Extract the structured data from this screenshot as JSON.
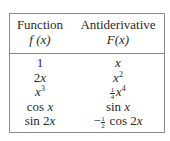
{
  "table": {
    "headers": [
      {
        "title": "Function",
        "notation": "f(x)"
      },
      {
        "title": "Antiderivative",
        "notation": "F(x)"
      }
    ],
    "rows": [
      {
        "function": "1",
        "antiderivative": "x"
      },
      {
        "function": "2x",
        "antiderivative": "x^2"
      },
      {
        "function": "x^3",
        "antiderivative": "(1/4)x^4"
      },
      {
        "function": "cos x",
        "antiderivative": "sin x"
      },
      {
        "function": "sin 2x",
        "antiderivative": "-(1/2) cos 2x"
      }
    ]
  },
  "display": {
    "h1_title": "Function",
    "h1_notation": "f (x)",
    "h2_title": "Antiderivative",
    "h2_notation": "F(x)",
    "r0": {
      "f": "1",
      "F": "x"
    },
    "r1": {
      "f_coef": "2",
      "f_var": "x",
      "F_var": "x",
      "F_exp": "2"
    },
    "r2": {
      "f_var": "x",
      "f_exp": "3",
      "F_num": "1",
      "F_den": "4",
      "F_var": "x",
      "F_exp": "4"
    },
    "r3": {
      "f_fn": "cos ",
      "f_var": "x",
      "F_fn": "sin ",
      "F_var": "x"
    },
    "r4": {
      "f_fn": "sin 2",
      "f_var": "x",
      "F_sign": "−",
      "F_num": "1",
      "F_den": "2",
      "F_fn": " cos 2",
      "F_var": "x"
    }
  },
  "colors": {
    "border": "#8a8a8a",
    "text": "#2a2a2a",
    "background": "#ffffff"
  }
}
